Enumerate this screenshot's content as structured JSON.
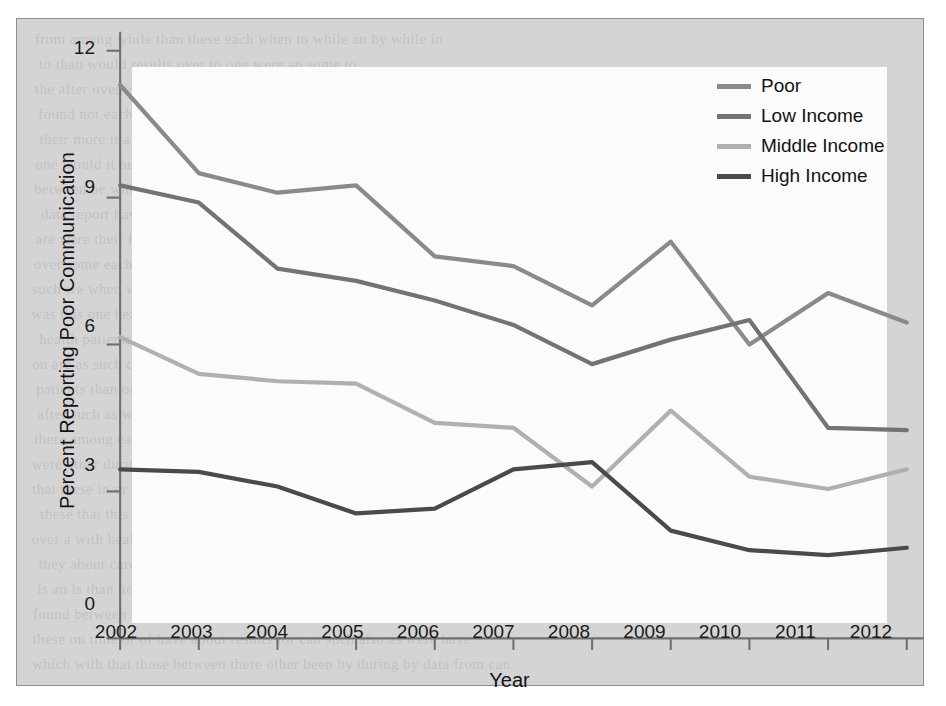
{
  "chart_data": {
    "type": "line",
    "title": "",
    "xlabel": "Year",
    "ylabel": "Percent Reporting Poor Communication",
    "x": [
      2002,
      2003,
      2004,
      2005,
      2006,
      2007,
      2008,
      2009,
      2010,
      2011,
      2012
    ],
    "categories": [
      "2002",
      "2003",
      "2004",
      "2005",
      "2006",
      "2007",
      "2008",
      "2009",
      "2010",
      "2011",
      "2012"
    ],
    "xlim": [
      2002,
      2012
    ],
    "ylim": [
      0,
      12
    ],
    "yticks": [
      0,
      3,
      6,
      9,
      12
    ],
    "ytick_labels": [
      "0",
      "3",
      "6",
      "9",
      "12"
    ],
    "grid": false,
    "legend_position": "top-right",
    "series": [
      {
        "name": "Poor",
        "color": "#8a8a8a",
        "values": [
          11.3,
          9.5,
          9.1,
          9.25,
          7.8,
          7.6,
          6.8,
          8.1,
          6.0,
          7.05,
          6.45
        ]
      },
      {
        "name": "Low Income",
        "color": "#737373",
        "values": [
          9.25,
          8.9,
          7.55,
          7.3,
          6.9,
          6.4,
          5.6,
          6.1,
          6.5,
          4.3,
          4.25
        ]
      },
      {
        "name": "Middle Income",
        "color": "#b0b0b0",
        "values": [
          6.15,
          5.4,
          5.25,
          5.2,
          4.4,
          4.3,
          3.1,
          4.65,
          3.3,
          3.05,
          3.45
        ]
      },
      {
        "name": "High Income",
        "color": "#4a4a4a",
        "values": [
          3.45,
          3.4,
          3.1,
          2.55,
          2.65,
          3.45,
          3.6,
          2.2,
          1.8,
          1.7,
          1.85
        ]
      }
    ]
  },
  "axis": {
    "y_title": "Percent Reporting Poor Communication",
    "x_title": "Year"
  },
  "legend": {
    "items": [
      {
        "label": "Poor"
      },
      {
        "label": "Low Income"
      },
      {
        "label": "Middle Income"
      },
      {
        "label": "High Income"
      }
    ]
  },
  "colors": {
    "page_background": "#d4d4d4",
    "plot_background": "#fbfbfb",
    "axis": "#6f6f6f",
    "text": "#141414",
    "poor": "#8a8a8a",
    "low_income": "#737373",
    "middle_income": "#b0b0b0",
    "high_income": "#4a4a4a"
  }
}
